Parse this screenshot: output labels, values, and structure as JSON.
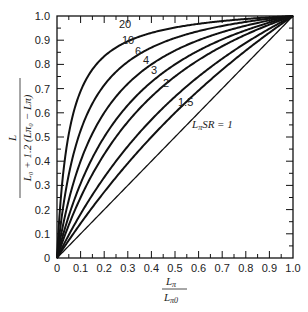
{
  "chart_data": {
    "type": "line",
    "title": "",
    "xlabel": "Lπ / Lπ0",
    "ylabel": "L / (L0 + 1.2(Lπ0 − Lπ))",
    "xlim": [
      0,
      1.0
    ],
    "ylim": [
      0,
      1.0
    ],
    "grid": false,
    "legend": "inline curve labels",
    "x_ticks": [
      "0",
      "0.1",
      "0.2",
      "0.3",
      "0.4",
      "0.5",
      "0.6",
      "0.7",
      "0.8",
      "0.9",
      "1.0"
    ],
    "y_ticks": [
      "0",
      "0.1",
      "0.2",
      "0.3",
      "0.4",
      "0.5",
      "0.6",
      "0.7",
      "0.8",
      "0.9",
      "1.0"
    ],
    "x": [
      0,
      0.02,
      0.05,
      0.1,
      0.2,
      0.3,
      0.4,
      0.5,
      0.6,
      0.7,
      0.8,
      0.9,
      1.0
    ],
    "series": [
      {
        "name": "20",
        "values": [
          0,
          0.29,
          0.51,
          0.69,
          0.83,
          0.9,
          0.93,
          0.95,
          0.97,
          0.98,
          0.99,
          0.99,
          1.0
        ]
      },
      {
        "name": "10",
        "values": [
          0,
          0.17,
          0.34,
          0.53,
          0.71,
          0.81,
          0.87,
          0.91,
          0.94,
          0.96,
          0.98,
          0.99,
          1.0
        ]
      },
      {
        "name": "6",
        "values": [
          0,
          0.11,
          0.24,
          0.4,
          0.6,
          0.72,
          0.8,
          0.86,
          0.9,
          0.93,
          0.96,
          0.98,
          1.0
        ]
      },
      {
        "name": "4",
        "values": [
          0,
          0.08,
          0.17,
          0.31,
          0.5,
          0.63,
          0.73,
          0.8,
          0.86,
          0.9,
          0.94,
          0.97,
          1.0
        ]
      },
      {
        "name": "3",
        "values": [
          0,
          0.06,
          0.14,
          0.25,
          0.43,
          0.56,
          0.67,
          0.75,
          0.82,
          0.88,
          0.92,
          0.96,
          1.0
        ]
      },
      {
        "name": "2",
        "values": [
          0,
          0.04,
          0.1,
          0.18,
          0.33,
          0.46,
          0.57,
          0.67,
          0.75,
          0.82,
          0.89,
          0.95,
          1.0
        ]
      },
      {
        "name": "1.5",
        "values": [
          0,
          0.03,
          0.07,
          0.14,
          0.27,
          0.39,
          0.5,
          0.6,
          0.69,
          0.78,
          0.86,
          0.93,
          1.0
        ]
      },
      {
        "name": "LπSR = 1",
        "values": [
          0,
          0.02,
          0.05,
          0.1,
          0.2,
          0.3,
          0.4,
          0.5,
          0.6,
          0.7,
          0.8,
          0.9,
          1.0
        ]
      }
    ]
  },
  "labels": {
    "c20": "20",
    "c10": "10",
    "c6": "6",
    "c4": "4",
    "c3": "3",
    "c2": "2",
    "c15": "1.5",
    "c1_pre": "L",
    "c1_sub": "π",
    "c1_post": "SR = 1",
    "x_num": "L",
    "x_num_sub": "π",
    "x_den": "L",
    "x_den_sub": "π0",
    "y_num": "L",
    "y_den": "L₀ + 1.2 (Lπ₀ − Lπ)"
  }
}
